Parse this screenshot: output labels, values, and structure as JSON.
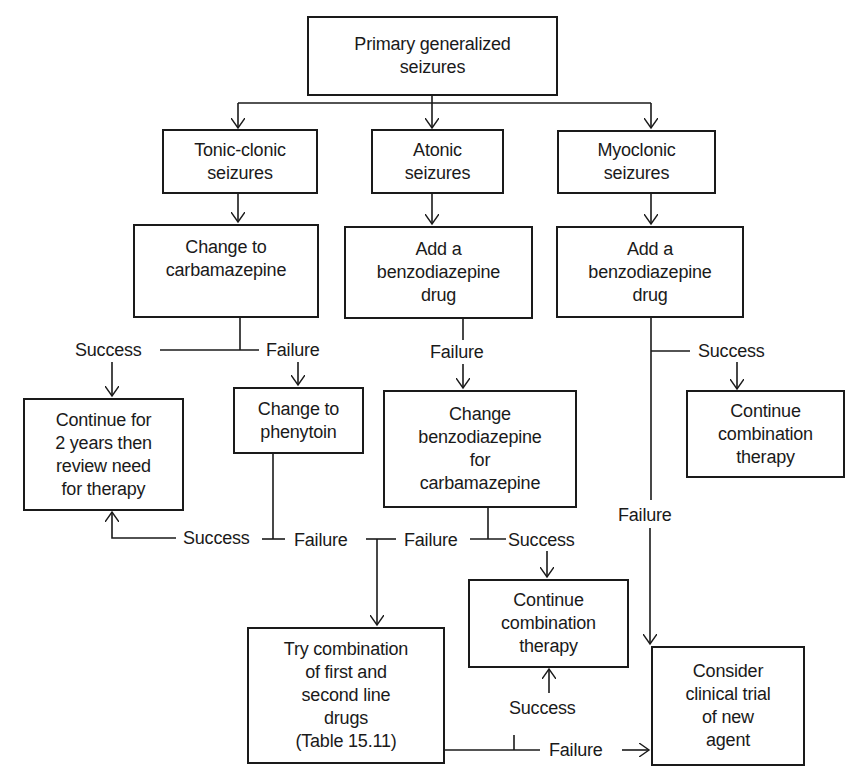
{
  "diagram": {
    "type": "flowchart",
    "nodes": {
      "root": "Primary generalized\nseizures",
      "tonic_clonic": "Tonic-clonic\nseizures",
      "atonic": "Atonic\nseizures",
      "myoclonic": "Myoclonic\nseizures",
      "change_carbamazepine": "Change to\ncarbamazepine",
      "atonic_add_benzo": "Add a\nbenzodiazepine\ndrug",
      "myoclonic_add_benzo": "Add a\nbenzodiazepine\ndrug",
      "continue_2_years": "Continue for\n2 years then\nreview need\nfor therapy",
      "change_phenytoin": "Change to\nphenytoin",
      "change_benzo_for_carb": "Change\nbenzodiazepine\nfor\ncarbamazepine",
      "continue_combo_right": "Continue\ncombination\ntherapy",
      "continue_combo_middle": "Continue\ncombination\ntherapy",
      "try_combination": "Try combination\nof first and\nsecond line\ndrugs\n(Table 15.11)",
      "clinical_trial": "Consider\nclinical trial\nof new\nagent"
    },
    "labels": {
      "carb_success": "Success",
      "carb_failure": "Failure",
      "atonic_failure": "Failure",
      "myo_success": "Success",
      "myo_failure": "Failure",
      "phenytoin_success": "Success",
      "phenytoin_failure": "Failure",
      "benzo_carb_failure": "Failure",
      "benzo_carb_success": "Success",
      "combo_success": "Success",
      "combo_failure": "Failure"
    },
    "edges": [
      {
        "from": "Primary generalized seizures",
        "to": "Tonic-clonic seizures"
      },
      {
        "from": "Primary generalized seizures",
        "to": "Atonic seizures"
      },
      {
        "from": "Primary generalized seizures",
        "to": "Myoclonic seizures"
      },
      {
        "from": "Tonic-clonic seizures",
        "to": "Change to carbamazepine"
      },
      {
        "from": "Atonic seizures",
        "to": "Add a benzodiazepine drug"
      },
      {
        "from": "Myoclonic seizures",
        "to": "Add a benzodiazepine drug"
      },
      {
        "from": "Change to carbamazepine",
        "to": "Continue for 2 years then review need for therapy",
        "label": "Success"
      },
      {
        "from": "Change to carbamazepine",
        "to": "Change to phenytoin",
        "label": "Failure"
      },
      {
        "from": "Add a benzodiazepine drug (atonic)",
        "to": "Change benzodiazepine for carbamazepine",
        "label": "Failure"
      },
      {
        "from": "Add a benzodiazepine drug (myoclonic)",
        "to": "Continue combination therapy",
        "label": "Success"
      },
      {
        "from": "Add a benzodiazepine drug (myoclonic)",
        "to": "Consider clinical trial of new agent",
        "label": "Failure"
      },
      {
        "from": "Change to phenytoin",
        "to": "Continue for 2 years then review need for therapy",
        "label": "Success"
      },
      {
        "from": "Change to phenytoin",
        "to": "Try combination of first and second line drugs",
        "label": "Failure"
      },
      {
        "from": "Change benzodiazepine for carbamazepine",
        "to": "Try combination of first and second line drugs",
        "label": "Failure"
      },
      {
        "from": "Change benzodiazepine for carbamazepine",
        "to": "Continue combination therapy",
        "label": "Success"
      },
      {
        "from": "Try combination of first and second line drugs",
        "to": "Continue combination therapy",
        "label": "Success"
      },
      {
        "from": "Try combination of first and second line drugs",
        "to": "Consider clinical trial of new agent",
        "label": "Failure"
      }
    ],
    "colors": {
      "stroke": "#1a1a1a",
      "background": "#ffffff"
    }
  }
}
